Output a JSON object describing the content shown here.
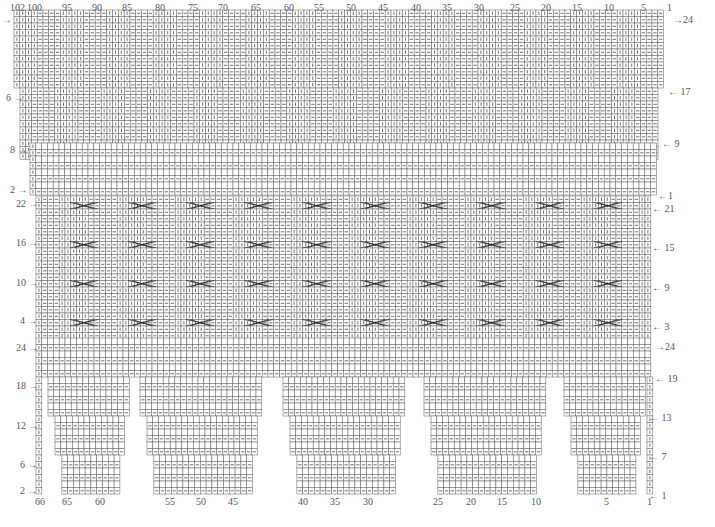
{
  "colors": {
    "grid": "#5a5a5a",
    "symbol": "#333333",
    "cable": "#2a2a2a",
    "label": "#555555"
  },
  "legend_symbols": {
    "knit": "vertical bar (|) — knit stitch",
    "purl": "horizontal dash (—) — purl stitch",
    "empty": "blank square",
    "cable": "cable cross (X)"
  },
  "chart_data": {
    "type": "table",
    "sections": [
      {
        "name": "top-band",
        "stitch_range": [
          1,
          102
        ],
        "rows": 24,
        "left_row_labels": [
          {
            "row": 24,
            "label": "→"
          },
          {
            "row": 6,
            "label": "6"
          }
        ],
        "right_row_labels": [
          {
            "row": 24,
            "label": "24"
          },
          {
            "row": 17,
            "label": "17"
          },
          {
            "row": 9,
            "label": "9"
          }
        ],
        "pattern": "rib: 4 knit / 4 purl repeat"
      },
      {
        "name": "garter-band",
        "rows": 9,
        "left_row_labels": [
          {
            "row": 8,
            "label": "8"
          },
          {
            "row": 2,
            "label": "2"
          }
        ],
        "right_row_labels": [
          {
            "row": 1,
            "label": "1"
          }
        ],
        "pattern": "alternating purl rows with blank rows"
      },
      {
        "name": "cable-panel",
        "rows": 24,
        "cable_count_per_row": 10,
        "cable_rows": [
          21,
          15,
          9,
          3
        ],
        "left_row_labels": [
          {
            "row": 22,
            "label": "22"
          },
          {
            "row": 16,
            "label": "16"
          },
          {
            "row": 10,
            "label": "10"
          },
          {
            "row": 4,
            "label": "4"
          }
        ],
        "right_row_labels": [
          {
            "row": 21,
            "label": "21"
          },
          {
            "row": 15,
            "label": "15"
          },
          {
            "row": 9,
            "label": "9"
          },
          {
            "row": 3,
            "label": "3"
          }
        ]
      },
      {
        "name": "lower-band",
        "rows": 6,
        "left_row_labels": [
          {
            "row": 24,
            "label": "24"
          }
        ],
        "right_row_labels": [
          {
            "row": 24,
            "label": "24"
          },
          {
            "row": 19,
            "label": "19"
          }
        ]
      },
      {
        "name": "leg-panels",
        "stitch_range": [
          1,
          66
        ],
        "rows": 18,
        "panel_count": 5,
        "left_row_labels": [
          {
            "row": 18,
            "label": "18"
          },
          {
            "row": 12,
            "label": "12"
          },
          {
            "row": 6,
            "label": "6"
          },
          {
            "row": 2,
            "label": "2"
          }
        ],
        "right_row_labels": [
          {
            "row": 13,
            "label": "13"
          },
          {
            "row": 7,
            "label": "7"
          },
          {
            "row": 1,
            "label": "1"
          }
        ]
      }
    ],
    "top_stitch_labels": [
      "102",
      "100",
      "95",
      "90",
      "85",
      "80",
      "75",
      "70",
      "65",
      "60",
      "55",
      "50",
      "45",
      "40",
      "35",
      "30",
      "25",
      "20",
      "15",
      "10",
      "5",
      "1"
    ],
    "bottom_stitch_labels": [
      "66",
      "65",
      "60",
      "55",
      "50",
      "45",
      "40",
      "35",
      "30",
      "25",
      "20",
      "15",
      "10",
      "5",
      "1"
    ]
  },
  "labels": {
    "top": [
      {
        "t": "102",
        "x": 10
      },
      {
        "t": "100",
        "x": 27
      },
      {
        "t": "95",
        "x": 62
      },
      {
        "t": "90",
        "x": 92
      },
      {
        "t": "85",
        "x": 122
      },
      {
        "t": "80",
        "x": 155
      },
      {
        "t": "75",
        "x": 188
      },
      {
        "t": "70",
        "x": 218
      },
      {
        "t": "65",
        "x": 251
      },
      {
        "t": "60",
        "x": 284
      },
      {
        "t": "55",
        "x": 314
      },
      {
        "t": "50",
        "x": 346
      },
      {
        "t": "45",
        "x": 378
      },
      {
        "t": "40",
        "x": 411
      },
      {
        "t": "35",
        "x": 442
      },
      {
        "t": "30",
        "x": 474
      },
      {
        "t": "25",
        "x": 510
      },
      {
        "t": "20",
        "x": 541
      },
      {
        "t": "15",
        "x": 572
      },
      {
        "t": "10",
        "x": 604
      },
      {
        "t": "5",
        "x": 641
      },
      {
        "t": "1",
        "x": 667
      }
    ],
    "bottom": [
      {
        "t": "66",
        "x": 35
      },
      {
        "t": "65",
        "x": 62
      },
      {
        "t": "60",
        "x": 95
      },
      {
        "t": "55",
        "x": 165
      },
      {
        "t": "50",
        "x": 196
      },
      {
        "t": "45",
        "x": 228
      },
      {
        "t": "40",
        "x": 298
      },
      {
        "t": "35",
        "x": 330
      },
      {
        "t": "30",
        "x": 363
      },
      {
        "t": "25",
        "x": 433
      },
      {
        "t": "20",
        "x": 466
      },
      {
        "t": "15",
        "x": 497
      },
      {
        "t": "10",
        "x": 531
      },
      {
        "t": "5",
        "x": 604
      },
      {
        "t": "1",
        "x": 647
      }
    ],
    "left": [
      {
        "t": "→",
        "y": 15,
        "x": 2
      },
      {
        "t": "6 →",
        "y": 93,
        "x": 6
      },
      {
        "t": "8 →",
        "y": 145,
        "x": 10
      },
      {
        "t": "2 →",
        "y": 185,
        "x": 10
      },
      {
        "t": "22 →",
        "y": 199,
        "x": 16
      },
      {
        "t": "16 →",
        "y": 238,
        "x": 16
      },
      {
        "t": "10 →",
        "y": 278,
        "x": 16
      },
      {
        "t": "4 →",
        "y": 316,
        "x": 20
      },
      {
        "t": "24 →",
        "y": 343,
        "x": 16
      },
      {
        "t": "18 →",
        "y": 381,
        "x": 16
      },
      {
        "t": "12 →",
        "y": 421,
        "x": 16
      },
      {
        "t": "6 →",
        "y": 460,
        "x": 20
      },
      {
        "t": "2 →",
        "y": 486,
        "x": 20
      }
    ],
    "right": [
      {
        "t": "→24",
        "y": 15,
        "x": 673
      },
      {
        "t": "← 17",
        "y": 87,
        "x": 668
      },
      {
        "t": "← 9",
        "y": 139,
        "x": 662
      },
      {
        "t": "←1",
        "y": 191,
        "x": 658
      },
      {
        "t": "← 21",
        "y": 204,
        "x": 652
      },
      {
        "t": "← 15",
        "y": 243,
        "x": 652
      },
      {
        "t": "← 9",
        "y": 283,
        "x": 652
      },
      {
        "t": "← 3",
        "y": 322,
        "x": 652
      },
      {
        "t": "→24",
        "y": 342,
        "x": 655
      },
      {
        "t": "← 19",
        "y": 374,
        "x": 655
      },
      {
        "t": "← 13",
        "y": 413,
        "x": 649
      },
      {
        "t": "← 7",
        "y": 452,
        "x": 649
      },
      {
        "t": "← 1",
        "y": 491,
        "x": 649
      }
    ]
  }
}
